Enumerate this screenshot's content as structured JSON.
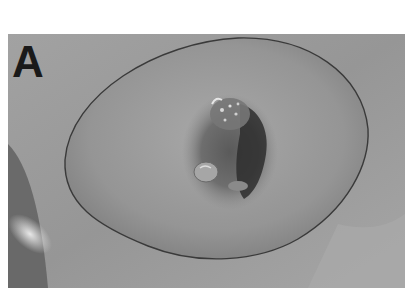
{
  "figure": {
    "panel_label": "A",
    "image_description": "Grayscale clinical photograph of a breast with a central ulcerated, crusted lesion at the nipple-areola region; a hand-drawn outline encircles the breast",
    "tone": "grayscale",
    "colors": {
      "background": "#9a9a9a",
      "skin_mid": "#8e8e8e",
      "skin_light": "#b4b4b4",
      "outline": "#3a3a3a",
      "lesion_dark": "#2e2e2e",
      "label": "#1a1a1a"
    }
  }
}
